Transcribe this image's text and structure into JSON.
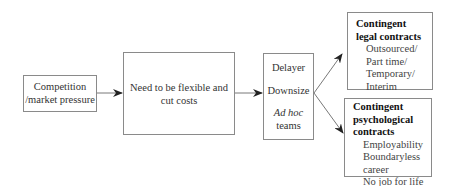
{
  "diagram": {
    "type": "flowchart",
    "nodes": [
      {
        "id": "competition",
        "lines": [
          "Competition",
          "/market pressure"
        ]
      },
      {
        "id": "need",
        "lines": [
          "Need to be flexible and",
          "cut costs"
        ]
      },
      {
        "id": "actions",
        "items": [
          "Delayer",
          "Downsize"
        ],
        "italic": "Ad hoc",
        "last": "teams"
      },
      {
        "id": "legal",
        "title_lines": [
          "Contingent",
          "legal contracts"
        ],
        "items": [
          "Outsourced/",
          "Part time/",
          "Temporary/",
          "Interim"
        ]
      },
      {
        "id": "psych",
        "title_lines": [
          "Contingent",
          "psychological",
          "contracts"
        ],
        "items": [
          "Employability",
          "Boundaryless",
          "career",
          "No job for life"
        ]
      }
    ],
    "edges": [
      {
        "from": "competition",
        "to": "need"
      },
      {
        "from": "need",
        "to": "actions"
      },
      {
        "from": "actions",
        "to": "legal"
      },
      {
        "from": "actions",
        "to": "psych"
      }
    ],
    "colors": {
      "border": "#8a8a8a",
      "arrow": "#333333",
      "text": "#333333"
    }
  }
}
